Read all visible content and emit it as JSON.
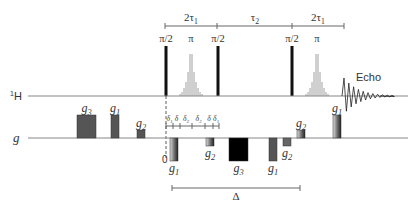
{
  "diagram": {
    "channels": {
      "proton": {
        "label_sup": "1",
        "label": "H",
        "baseline_y": 96
      },
      "gradient": {
        "label": "g",
        "baseline_y": 138
      }
    },
    "timing_top": {
      "y": 26,
      "ticks_x": [
        165,
        217,
        292,
        344
      ],
      "intervals": [
        {
          "label": "2τ",
          "sub": "1",
          "x": 191
        },
        {
          "label": "τ",
          "sub": "2",
          "x": 255
        },
        {
          "label": "2τ",
          "sub": "1",
          "x": 318
        }
      ]
    },
    "rf_pulses": [
      {
        "type": "hard",
        "label": "π/2",
        "x": 166
      },
      {
        "type": "selective",
        "label": "π",
        "x": 191
      },
      {
        "type": "hard",
        "label": "π/2",
        "x": 218
      },
      {
        "type": "hard",
        "label": "π/2",
        "x": 292
      },
      {
        "type": "selective",
        "label": "π",
        "x": 317
      }
    ],
    "echo": {
      "label": "Echo",
      "x": 344
    },
    "gradients": [
      {
        "name": "g",
        "sub": "3",
        "x": 77,
        "w": 19,
        "h": 23,
        "dir": "up",
        "fill": "#555555"
      },
      {
        "name": "g",
        "sub": "1",
        "x": 111,
        "w": 8,
        "h": 23,
        "dir": "up",
        "fill": "#555555"
      },
      {
        "name": "g",
        "sub": "2",
        "x": 137,
        "w": 8,
        "h": 8,
        "dir": "up",
        "fill": "#555555"
      },
      {
        "name": "g",
        "sub": "1",
        "x": 170,
        "w": 8,
        "h": 23,
        "dir": "down",
        "fill": "gradient"
      },
      {
        "name": "g",
        "sub": "2",
        "x": 206,
        "w": 8,
        "h": 8,
        "dir": "down",
        "fill": "gradient"
      },
      {
        "name": "g",
        "sub": "3",
        "x": 229,
        "w": 19,
        "h": 23,
        "dir": "down",
        "fill": "#000000"
      },
      {
        "name": "g",
        "sub": "1",
        "x": 269,
        "w": 8,
        "h": 23,
        "dir": "down",
        "fill": "#555555"
      },
      {
        "name": "g",
        "sub": "2",
        "x": 283,
        "w": 8,
        "h": 8,
        "dir": "down",
        "fill": "#666666"
      },
      {
        "name": "g",
        "sub": "2",
        "x": 297,
        "w": 8,
        "h": 8,
        "dir": "up",
        "fill": "gradient"
      },
      {
        "name": "g",
        "sub": "1",
        "x": 333,
        "w": 8,
        "h": 23,
        "dir": "up",
        "fill": "gradient"
      }
    ],
    "delta_ruler": {
      "y": 126,
      "ticks_x": [
        166,
        173,
        180,
        192,
        205,
        213,
        219
      ],
      "labels": [
        "δ₁",
        "δ",
        "δ₂",
        "δ₂",
        "δ",
        "δ₁"
      ]
    },
    "zero_label": "0",
    "big_delta": {
      "label": "Δ",
      "x1": 172,
      "x2": 300,
      "y": 188
    },
    "colors": {
      "line": "#888888",
      "pulse": "#111111",
      "text": "#333333"
    }
  }
}
